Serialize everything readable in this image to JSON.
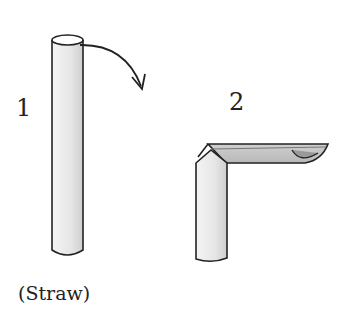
{
  "figure": {
    "step1_label": "1",
    "step2_label": "2",
    "caption": "(Straw)"
  },
  "colors": {
    "outline": "#222222",
    "straw_fill": "#ececec",
    "shadow": "#c8c8c8"
  }
}
